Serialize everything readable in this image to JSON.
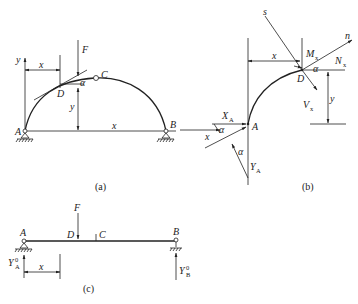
{
  "figure_a": {
    "caption": "(a)",
    "labels": {
      "A": "A",
      "B": "B",
      "C": "C",
      "D": "D",
      "F": "F",
      "x_dim": "x",
      "x_axis": "x",
      "y_axis": "y",
      "y_dim": "y",
      "alpha": "α"
    }
  },
  "figure_b": {
    "caption": "(b)",
    "labels": {
      "s": "s",
      "n": "n",
      "x_dim": "x",
      "M": "M",
      "M_sub": "x",
      "N": "N",
      "N_sub": "x",
      "V": "V",
      "V_sub": "x",
      "D": "D",
      "A": "A",
      "alpha1": "α",
      "alpha2": "α",
      "alpha3": "α",
      "XA": "X",
      "XA_sub": "A",
      "YA": "Y",
      "YA_sub": "A",
      "x_axis": "x",
      "y_dim": "y"
    }
  },
  "figure_c": {
    "caption": "(c)",
    "labels": {
      "A": "A",
      "B": "B",
      "C": "C",
      "D": "D",
      "F": "F",
      "x_dim": "x",
      "YA": "Y",
      "YA_sup": "0",
      "YA_sub": "A",
      "YB": "Y",
      "YB_sup": "0",
      "YB_sub": "B"
    }
  }
}
